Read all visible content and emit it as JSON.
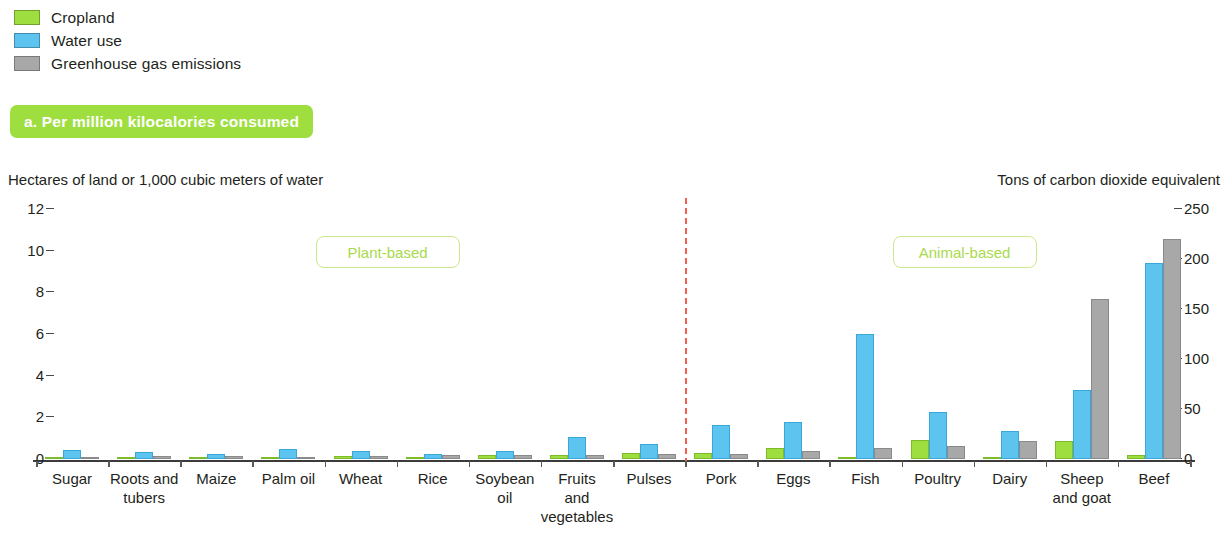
{
  "legend": {
    "items": [
      {
        "label": "Cropland",
        "color": "#9ede3f",
        "icon": "legend-swatch-cropland"
      },
      {
        "label": "Water use",
        "color": "#5cc4ef",
        "icon": "legend-swatch-water"
      },
      {
        "label": "Greenhouse gas emissions",
        "color": "#a8a8a8",
        "icon": "legend-swatch-ghg"
      }
    ]
  },
  "panel": {
    "title": "a. Per million kilocalories consumed",
    "title_bg": "#9ede3f",
    "title_color": "#ffffff"
  },
  "axes": {
    "left_caption": "Hectares of land or 1,000 cubic meters of water",
    "right_caption": "Tons of carbon dioxide equivalent",
    "left_ticks": [
      "12",
      "10",
      "8",
      "6",
      "4",
      "2",
      "0"
    ],
    "right_ticks": [
      "250",
      "200",
      "150",
      "100",
      "50",
      "0"
    ]
  },
  "regions": [
    {
      "label": "Plant-based",
      "color": "#a9d94b"
    },
    {
      "label": "Animal-based",
      "color": "#a9d94b"
    }
  ],
  "divider": {
    "color": "#f0604d",
    "style": "dashed"
  },
  "chart_data": {
    "type": "bar",
    "title": "a. Per million kilocalories consumed",
    "xlabel": "",
    "ylabel": "Hectares of land or 1,000 cubic meters of water",
    "y2label": "Tons of carbon dioxide equivalent",
    "ylim": [
      0,
      12
    ],
    "y2lim": [
      0,
      250
    ],
    "yticks": [
      0,
      2,
      4,
      6,
      8,
      10,
      12
    ],
    "y2ticks": [
      0,
      50,
      100,
      150,
      200,
      250
    ],
    "grid": false,
    "legend_position": "top-left",
    "categories": [
      "Sugar",
      "Roots and tubers",
      "Maize",
      "Palm oil",
      "Wheat",
      "Rice",
      "Soybean oil",
      "Fruits and vegetables",
      "Pulses",
      "Pork",
      "Eggs",
      "Fish",
      "Poultry",
      "Dairy",
      "Sheep and goat",
      "Beef"
    ],
    "category_groups": {
      "Plant-based": [
        "Sugar",
        "Roots and tubers",
        "Maize",
        "Palm oil",
        "Wheat",
        "Rice",
        "Soybean oil",
        "Fruits and vegetables",
        "Pulses"
      ],
      "Animal-based": [
        "Pork",
        "Eggs",
        "Fish",
        "Poultry",
        "Dairy",
        "Sheep and goat",
        "Beef"
      ]
    },
    "series": [
      {
        "name": "Cropland",
        "axis": "left",
        "unit": "hectares",
        "color": "#9ede3f",
        "values": [
          0.05,
          0.12,
          0.1,
          0.05,
          0.15,
          0.05,
          0.2,
          0.2,
          0.3,
          0.3,
          0.55,
          0.05,
          0.9,
          0.1,
          0.85,
          0.2
        ]
      },
      {
        "name": "Water use",
        "axis": "left",
        "unit": "1,000 cubic meters",
        "color": "#5cc4ef",
        "values": [
          0.45,
          0.35,
          0.25,
          0.5,
          0.4,
          0.25,
          0.4,
          1.05,
          0.7,
          1.65,
          1.8,
          6.0,
          2.25,
          1.35,
          3.3,
          9.4
        ]
      },
      {
        "name": "Greenhouse gas emissions",
        "axis": "right",
        "unit": "tons CO2 equivalent",
        "color": "#a8a8a8",
        "values": [
          2,
          3,
          3,
          2,
          3,
          4,
          4,
          4,
          5,
          5,
          8,
          11,
          13,
          18,
          160,
          220
        ]
      }
    ]
  }
}
